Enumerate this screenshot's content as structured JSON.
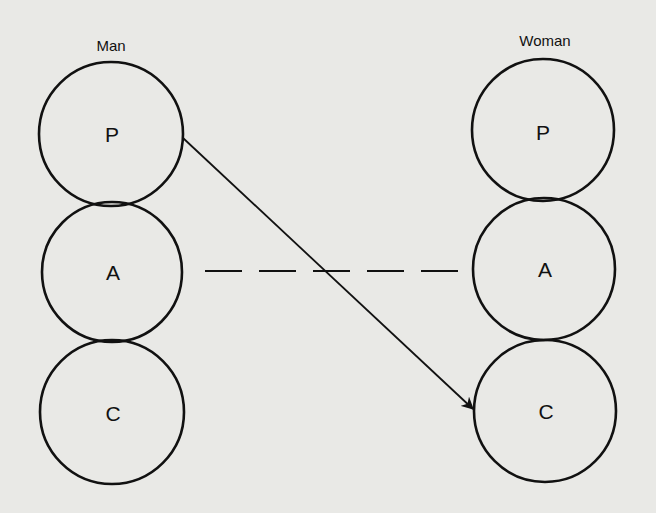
{
  "diagram": {
    "title": "",
    "columns": [
      {
        "id": "man",
        "label": "Man",
        "states": [
          {
            "id": "P",
            "label": "P"
          },
          {
            "id": "A",
            "label": "A"
          },
          {
            "id": "C",
            "label": "C"
          }
        ]
      },
      {
        "id": "woman",
        "label": "Woman",
        "states": [
          {
            "id": "P",
            "label": "P"
          },
          {
            "id": "A",
            "label": "A"
          },
          {
            "id": "C",
            "label": "C"
          }
        ]
      }
    ],
    "connections": [
      {
        "from": "man.P",
        "to": "woman.C",
        "style": "solid",
        "arrowhead": true
      },
      {
        "from": "man.A",
        "to": "woman.A",
        "style": "dashed",
        "arrowhead": false
      }
    ],
    "colors": {
      "background": "#e9e9e6",
      "ink": "#111111"
    }
  }
}
